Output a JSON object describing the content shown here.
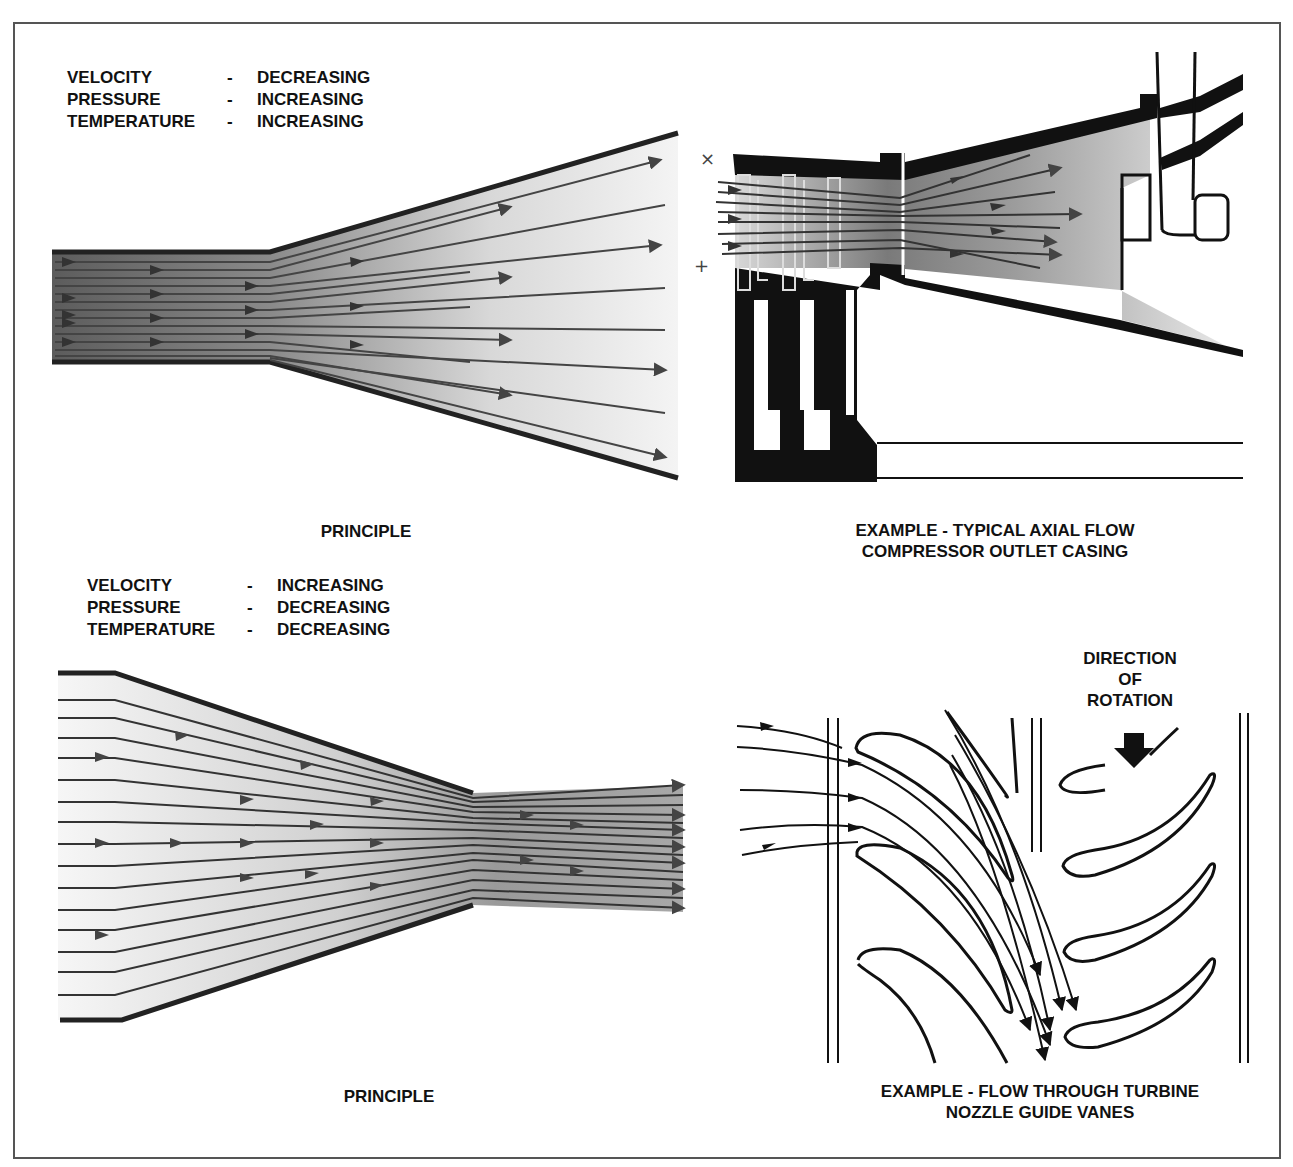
{
  "panels": {
    "diverging_principle": {
      "properties": [
        {
          "name": "VELOCITY",
          "sep": "-",
          "trend": "DECREASING"
        },
        {
          "name": "PRESSURE",
          "sep": "-",
          "trend": "INCREASING"
        },
        {
          "name": "TEMPERATURE",
          "sep": "-",
          "trend": "INCREASING"
        }
      ],
      "caption": "PRINCIPLE"
    },
    "compressor_example": {
      "caption_line1": "EXAMPLE  -  TYPICAL AXIAL FLOW",
      "caption_line2": "COMPRESSOR OUTLET CASING"
    },
    "converging_principle": {
      "properties": [
        {
          "name": "VELOCITY",
          "sep": "-",
          "trend": "INCREASING"
        },
        {
          "name": "PRESSURE",
          "sep": "-",
          "trend": "DECREASING"
        },
        {
          "name": "TEMPERATURE",
          "sep": "-",
          "trend": "DECREASING"
        }
      ],
      "caption": "PRINCIPLE"
    },
    "turbine_example": {
      "rotation_label_line1": "DIRECTION",
      "rotation_label_line2": "OF",
      "rotation_label_line3": "ROTATION",
      "caption_line1": "EXAMPLE  -  FLOW THROUGH TURBINE",
      "caption_line2": "NOZZLE GUIDE VANES"
    }
  },
  "colors": {
    "ink": "#111111",
    "flow_arrow": "#444444",
    "frame": "#555555",
    "fluid_dark": "#6a6a6a",
    "fluid_light": "#f2f2f2"
  }
}
